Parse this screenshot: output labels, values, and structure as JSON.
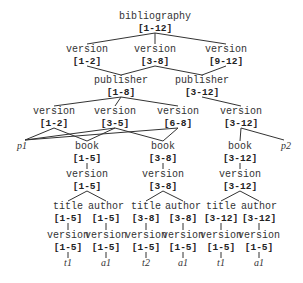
{
  "diagram": {
    "type": "version-tree",
    "nodes": [
      {
        "id": "bib",
        "label": "bibliography",
        "range": "[1-12]"
      },
      {
        "id": "v1",
        "label": "version",
        "range": "[1-2]"
      },
      {
        "id": "v2",
        "label": "version",
        "range": "[3-8]"
      },
      {
        "id": "v3",
        "label": "version",
        "range": "[9-12]"
      },
      {
        "id": "pub1",
        "label": "publisher",
        "range": "[1-8]"
      },
      {
        "id": "pub2",
        "label": "publisher",
        "range": "[3-12]"
      },
      {
        "id": "pv1",
        "label": "version",
        "range": "[1-2]"
      },
      {
        "id": "pv2",
        "label": "version",
        "range": "[3-5]"
      },
      {
        "id": "pv3",
        "label": "version",
        "range": "[6-8]"
      },
      {
        "id": "pv4",
        "label": "version",
        "range": "[3-12]"
      },
      {
        "id": "p1",
        "label": "p1",
        "leaf": true
      },
      {
        "id": "book1",
        "label": "book",
        "range": "[1-5]"
      },
      {
        "id": "book2",
        "label": "book",
        "range": "[3-8]"
      },
      {
        "id": "book3",
        "label": "book",
        "range": "[3-12]"
      },
      {
        "id": "p2",
        "label": "p2",
        "leaf": true
      },
      {
        "id": "bv1",
        "label": "version",
        "range": "[1-5]"
      },
      {
        "id": "bv2",
        "label": "version",
        "range": "[3-8]"
      },
      {
        "id": "bv3",
        "label": "version",
        "range": "[3-12]"
      },
      {
        "id": "title1",
        "label": "title",
        "range": "[1-5]"
      },
      {
        "id": "author1",
        "label": "author",
        "range": "[1-5]"
      },
      {
        "id": "title2",
        "label": "title",
        "range": "[3-8]"
      },
      {
        "id": "author2",
        "label": "author",
        "range": "[3-8]"
      },
      {
        "id": "title3",
        "label": "title",
        "range": "[3-12]"
      },
      {
        "id": "author3",
        "label": "author",
        "range": "[3-12]"
      },
      {
        "id": "tv1",
        "label": "version",
        "range": "[1-5]"
      },
      {
        "id": "av1",
        "label": "version",
        "range": "[1-5]"
      },
      {
        "id": "tv2",
        "label": "version",
        "range": "[1-5]"
      },
      {
        "id": "av2",
        "label": "version",
        "range": "[1-5]"
      },
      {
        "id": "tv3",
        "label": "version",
        "range": "[1-5]"
      },
      {
        "id": "av3",
        "label": "version",
        "range": "[1-5]"
      },
      {
        "id": "t1a",
        "label": "t1",
        "leaf": true
      },
      {
        "id": "a1a",
        "label": "a1",
        "leaf": true
      },
      {
        "id": "t2",
        "label": "t2",
        "leaf": true
      },
      {
        "id": "a1b",
        "label": "a1",
        "leaf": true
      },
      {
        "id": "t1b",
        "label": "t1",
        "leaf": true
      },
      {
        "id": "a1c",
        "label": "a1",
        "leaf": true
      }
    ],
    "edges": [
      [
        "bib",
        "v1"
      ],
      [
        "bib",
        "v2"
      ],
      [
        "bib",
        "v3"
      ],
      [
        "v1",
        "pub1"
      ],
      [
        "v2",
        "pub1"
      ],
      [
        "v2",
        "pub2"
      ],
      [
        "v3",
        "pub2"
      ],
      [
        "pub1",
        "pv1"
      ],
      [
        "pub1",
        "pv2"
      ],
      [
        "pub1",
        "pv3"
      ],
      [
        "pub2",
        "pv4"
      ],
      [
        "pv1",
        "p1"
      ],
      [
        "pv2",
        "p1"
      ],
      [
        "pv3",
        "p1"
      ],
      [
        "pv1",
        "book1"
      ],
      [
        "pv2",
        "book1"
      ],
      [
        "pv2",
        "book2"
      ],
      [
        "pv3",
        "book2"
      ],
      [
        "pv4",
        "book3"
      ],
      [
        "pv4",
        "p2"
      ],
      [
        "book1",
        "bv1"
      ],
      [
        "book2",
        "bv2"
      ],
      [
        "book3",
        "bv3"
      ],
      [
        "bv1",
        "title1"
      ],
      [
        "bv1",
        "author1"
      ],
      [
        "bv2",
        "title2"
      ],
      [
        "bv2",
        "author2"
      ],
      [
        "bv3",
        "title3"
      ],
      [
        "bv3",
        "author3"
      ],
      [
        "title1",
        "tv1"
      ],
      [
        "author1",
        "av1"
      ],
      [
        "title2",
        "tv2"
      ],
      [
        "author2",
        "av2"
      ],
      [
        "title3",
        "tv3"
      ],
      [
        "author3",
        "av3"
      ],
      [
        "tv1",
        "t1a"
      ],
      [
        "av1",
        "a1a"
      ],
      [
        "tv2",
        "t2"
      ],
      [
        "av2",
        "a1b"
      ],
      [
        "tv3",
        "t1b"
      ],
      [
        "av3",
        "a1c"
      ]
    ]
  }
}
